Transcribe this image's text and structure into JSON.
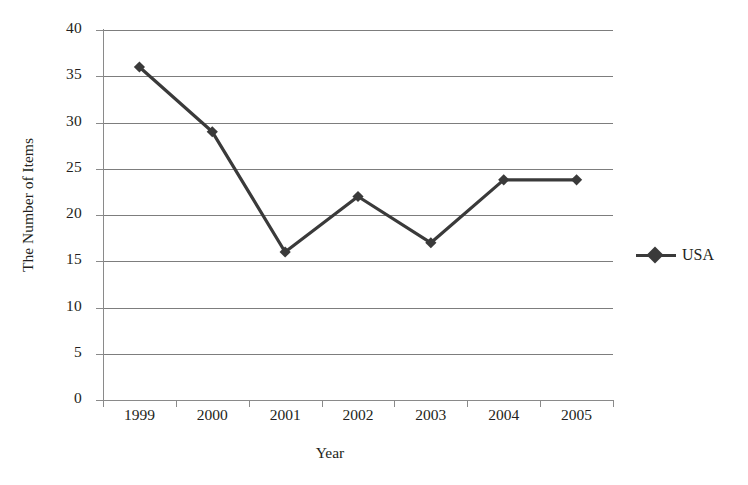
{
  "chart_data": {
    "type": "line",
    "title": "",
    "xlabel": "Year",
    "ylabel": "The Number of Items",
    "categories": [
      "1999",
      "2000",
      "2001",
      "2002",
      "2003",
      "2004",
      "2005"
    ],
    "series": [
      {
        "name": "USA",
        "values": [
          36,
          29,
          16,
          22,
          17,
          23.8,
          23.8
        ],
        "color": "#3a3a3a",
        "marker": "diamond"
      }
    ],
    "ylim": [
      0,
      40
    ],
    "ytick_step": 5,
    "yticks": [
      "0",
      "5",
      "10",
      "15",
      "20",
      "25",
      "30",
      "35",
      "40"
    ],
    "grid": "horizontal",
    "legend_position": "right"
  },
  "legend": {
    "entries": [
      {
        "label": "USA",
        "marker_name": "diamond-marker"
      }
    ]
  },
  "axes": {
    "x_title": "Year",
    "y_title": "The Number of Items"
  }
}
